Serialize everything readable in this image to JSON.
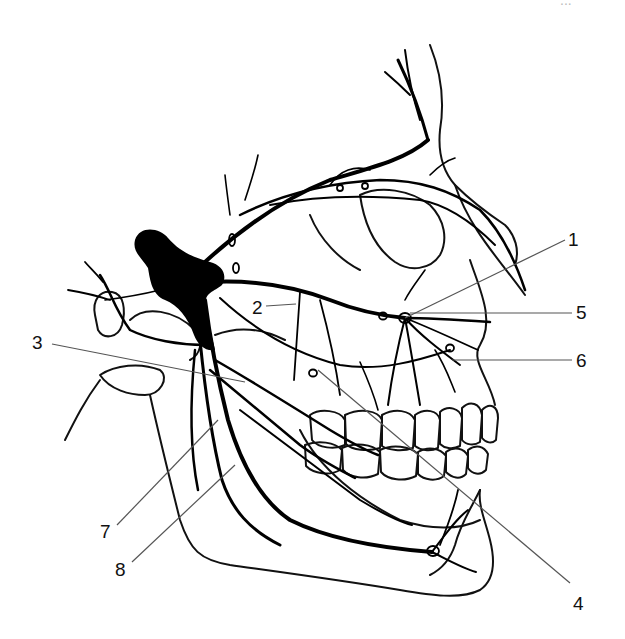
{
  "figure": {
    "page_number_fragment": "...",
    "ink_color": "#000000",
    "background_color": "#ffffff",
    "leader_color": "#555555"
  },
  "labels": [
    {
      "id": "1",
      "text": "1",
      "x": 568,
      "y": 230
    },
    {
      "id": "2",
      "text": "2",
      "x": 252,
      "y": 300
    },
    {
      "id": "3",
      "text": "3",
      "x": 32,
      "y": 335
    },
    {
      "id": "4",
      "text": "4",
      "x": 576,
      "y": 598
    },
    {
      "id": "5",
      "text": "5",
      "x": 576,
      "y": 305
    },
    {
      "id": "6",
      "text": "6",
      "x": 576,
      "y": 352
    },
    {
      "id": "7",
      "text": "7",
      "x": 100,
      "y": 524
    },
    {
      "id": "8",
      "text": "8",
      "x": 115,
      "y": 562
    }
  ]
}
